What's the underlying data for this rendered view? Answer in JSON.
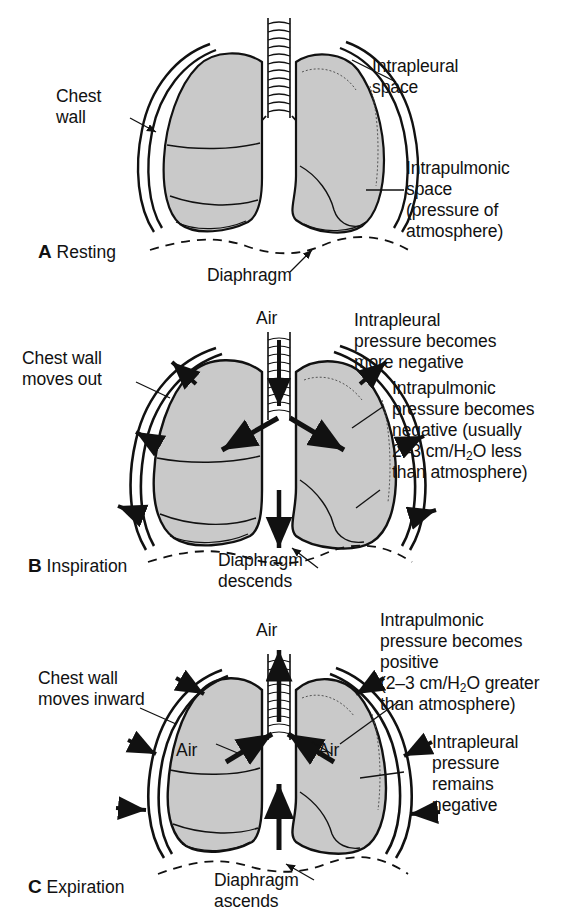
{
  "figure": {
    "fill_gray": "#c9c9c9",
    "line_color": "#111111",
    "background": "#ffffff"
  },
  "panels": [
    {
      "id": "A",
      "tag_letter": "A",
      "tag_label": "Resting",
      "labels": {
        "chest_wall": "Chest\nwall",
        "intrapleural_space": "Intrapleural\nspace",
        "intrapulmonic_space": "Intrapulmonic\nspace\n(pressure of\natmosphere)",
        "diaphragm": "Diaphragm"
      }
    },
    {
      "id": "B",
      "tag_letter": "B",
      "tag_label": "Inspiration",
      "labels": {
        "air": "Air",
        "chest_wall": "Chest wall\nmoves out",
        "intrapleural": "Intrapleural\npressure becomes\nmore negative",
        "intrapulmonic_line1": "Intrapulmonic",
        "intrapulmonic_line2": "pressure becomes",
        "intrapulmonic_line3": "negative (usually",
        "intrapulmonic_line4_pre": "2–3 cm/H",
        "intrapulmonic_line4_sub": "2",
        "intrapulmonic_line4_post": "O less",
        "intrapulmonic_line5": "than atmosphere)",
        "diaphragm": "Diaphragm\ndescends"
      }
    },
    {
      "id": "C",
      "tag_letter": "C",
      "tag_label": "Expiration",
      "labels": {
        "air_top": "Air",
        "air_left": "Air",
        "air_right": "Air",
        "chest_wall": "Chest wall\nmoves inward",
        "intrapulmonic_line1": "Intrapulmonic",
        "intrapulmonic_line2": "pressure becomes",
        "intrapulmonic_line3": "positive",
        "intrapulmonic_line4_pre": "(2–3 cm/H",
        "intrapulmonic_line4_sub": "2",
        "intrapulmonic_line4_post": "O greater",
        "intrapulmonic_line5": "than atmosphere)",
        "intrapleural": "Intrapleural\npressure\nremains\nnegative",
        "diaphragm": "Diaphragm\nascends"
      }
    }
  ]
}
